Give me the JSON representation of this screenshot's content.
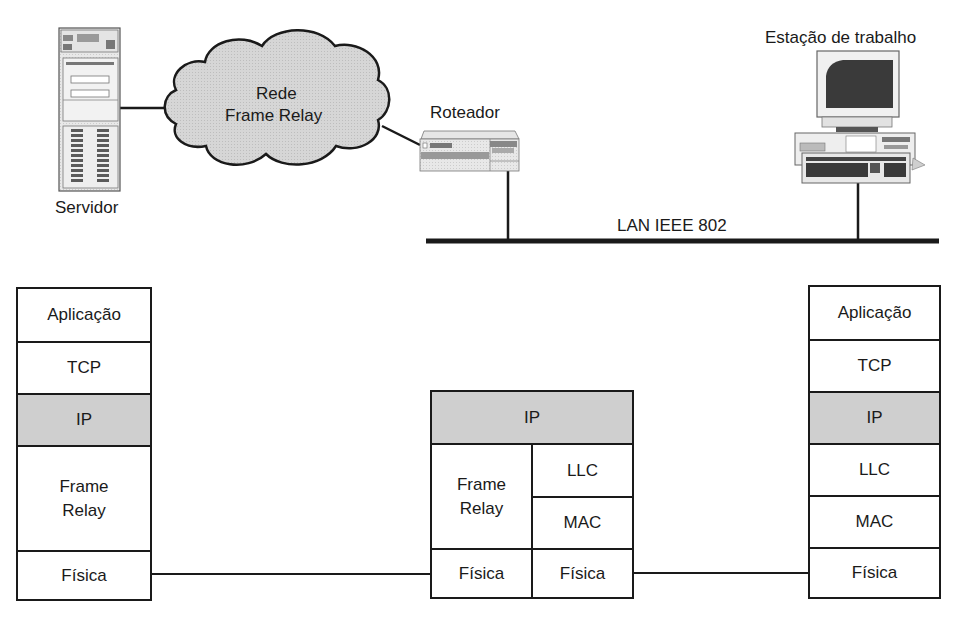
{
  "diagram": {
    "type": "network-protocol-architecture",
    "colors": {
      "line": "#1a1a1a",
      "shaded_layer": "#cfcfcf",
      "cloud_fill": "#d4d4d4",
      "device_fill": "#e6e6e6",
      "background": "#ffffff"
    },
    "devices": {
      "server": {
        "label": "Servidor",
        "icon": "server-tower-icon"
      },
      "cloud": {
        "line1": "Rede",
        "line2": "Frame Relay",
        "icon": "cloud-icon"
      },
      "router": {
        "label": "Roteador",
        "icon": "router-icon"
      },
      "workstation": {
        "label": "Estação de trabalho",
        "icon": "workstation-icon"
      },
      "lan": {
        "label": "LAN IEEE 802"
      }
    },
    "stacks": {
      "left": {
        "layers": [
          {
            "label": "Aplicação",
            "shaded": false
          },
          {
            "label": "TCP",
            "shaded": false
          },
          {
            "label": "IP",
            "shaded": true
          },
          {
            "label": "Frame\nRelay",
            "shaded": false
          },
          {
            "label": "Física",
            "shaded": false
          }
        ]
      },
      "middle": {
        "top": {
          "label": "IP",
          "shaded": true
        },
        "left_column": [
          {
            "label": "Frame\nRelay"
          },
          {
            "label": "Física"
          }
        ],
        "right_column": [
          {
            "label": "LLC"
          },
          {
            "label": "MAC"
          },
          {
            "label": "Física"
          }
        ]
      },
      "right": {
        "layers": [
          {
            "label": "Aplicação",
            "shaded": false
          },
          {
            "label": "TCP",
            "shaded": false
          },
          {
            "label": "IP",
            "shaded": true
          },
          {
            "label": "LLC",
            "shaded": false
          },
          {
            "label": "MAC",
            "shaded": false
          },
          {
            "label": "Física",
            "shaded": false
          }
        ]
      }
    }
  }
}
